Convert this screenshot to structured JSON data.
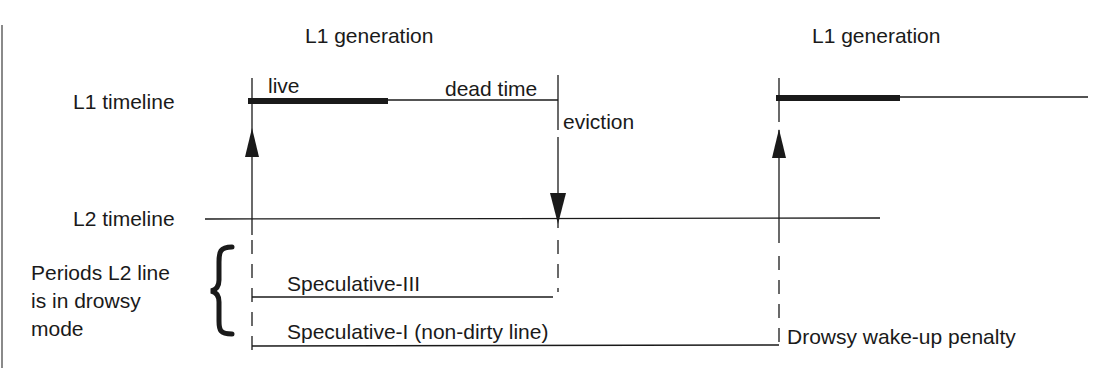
{
  "diagram": {
    "generation_labels": [
      "L1 generation",
      "L1 generation"
    ],
    "timelines": {
      "l1": "L1 timeline",
      "l2": "L2 timeline"
    },
    "annotations": {
      "live": "live",
      "dead_time": "dead time",
      "eviction": "eviction"
    },
    "drowsy_legend": {
      "line1": "Periods L2 line",
      "line2": "is in drowsy",
      "line3": "mode"
    },
    "periods": [
      {
        "label": "Speculative-III"
      },
      {
        "label": "Speculative-I (non-dirty line)"
      }
    ],
    "penalty_label": "Drowsy wake-up penalty",
    "colors": {
      "ink": "#1a1a1a",
      "border": "#8a8a8a",
      "background": "#ffffff"
    }
  }
}
